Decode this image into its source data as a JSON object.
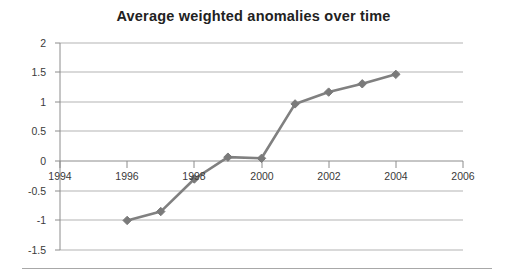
{
  "chart": {
    "title": "Average weighted anomalies over time"
  },
  "chart_data": {
    "type": "line",
    "title": "Average weighted anomalies over time",
    "xlabel": "",
    "ylabel": "",
    "x": [
      1996,
      1997,
      1998,
      1999,
      2000,
      2001,
      2002,
      2003,
      2004
    ],
    "values": [
      -1.0,
      -0.85,
      -0.3,
      0.07,
      0.05,
      0.97,
      1.17,
      1.31,
      1.47
    ],
    "series": [
      {
        "name": "Average weighted anomalies",
        "x": [
          1996,
          1997,
          1998,
          1999,
          2000,
          2001,
          2002,
          2003,
          2004
        ],
        "values": [
          -1.0,
          -0.85,
          -0.3,
          0.07,
          0.05,
          0.97,
          1.17,
          1.31,
          1.47
        ]
      }
    ],
    "xlim": [
      1994,
      2006
    ],
    "ylim": [
      -1.5,
      2
    ],
    "xticks": [
      1994,
      1996,
      1998,
      2000,
      2002,
      2004,
      2006
    ],
    "xtick_labels": [
      "1994",
      "1996",
      "1998",
      "2000",
      "2002",
      "2004",
      "2006"
    ],
    "yticks": [
      -1.5,
      -1,
      -0.5,
      0,
      0.5,
      1,
      1.5,
      2
    ],
    "ytick_labels": [
      "-1.5",
      "-1",
      "-0.5",
      "0",
      "0.5",
      "1",
      "1.5",
      "2"
    ],
    "grid": true,
    "grid_axis": "y",
    "legend": false,
    "legend_position": "none",
    "marker": "diamond",
    "line_color": "#808080",
    "marker_color": "#7a7a7a",
    "grid_color": "#b3b3b3",
    "axis_color": "#808080"
  },
  "axis": {
    "y_labels": [
      "2",
      "1.5",
      "1",
      "0.5",
      "0",
      "-0.5",
      "-1",
      "-1.5"
    ],
    "x_labels": [
      "1994",
      "1996",
      "1998",
      "2000",
      "2002",
      "2004",
      "2006"
    ]
  }
}
